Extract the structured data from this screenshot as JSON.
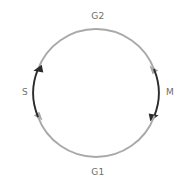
{
  "diagram": {
    "type": "circular-cycle",
    "background_color": "#ffffff",
    "center": {
      "x": 96,
      "y": 93
    },
    "radius": 62,
    "direction": "clockwise",
    "colors": {
      "dark_arc": "#2b2b2b",
      "light_arc": "#a9a9a9",
      "label_text": "#6e6e6e"
    },
    "labels": {
      "top": "G2",
      "bottom": "G1",
      "left": "S",
      "right": "M"
    },
    "phases": [
      {
        "id": "g1",
        "label": "G1",
        "position": "bottom",
        "arc_color": "#a9a9a9",
        "arc_start_deg": 20,
        "arc_end_deg": 160,
        "arrow_at": "end",
        "arrow_color": "#a9a9a9"
      },
      {
        "id": "s",
        "label": "S",
        "position": "left",
        "arc_color": "#2b2b2b",
        "arc_start_deg": 160,
        "arc_end_deg": 200,
        "arrow_at": "end",
        "arrow_color": "#2b2b2b"
      },
      {
        "id": "g2",
        "label": "G2",
        "position": "top",
        "arc_color": "#a9a9a9",
        "arc_start_deg": 200,
        "arc_end_deg": 340,
        "arrow_at": "end",
        "arrow_color": "#a9a9a9"
      },
      {
        "id": "m",
        "label": "M",
        "position": "right",
        "arc_color": "#2b2b2b",
        "arc_start_deg": 340,
        "arc_end_deg": 20,
        "arrow_at": "end",
        "arrow_color": "#2b2b2b"
      }
    ]
  }
}
